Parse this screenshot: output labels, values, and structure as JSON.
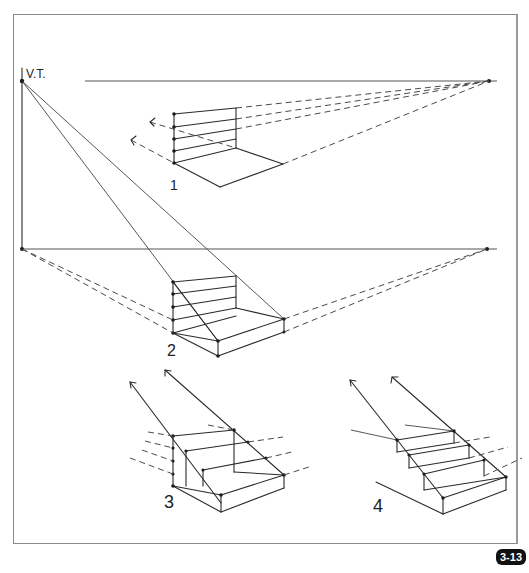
{
  "figure": {
    "number_badge": "3-13",
    "vertical_trace_label": "V.T.",
    "step_labels": [
      "1",
      "2",
      "3",
      "4"
    ],
    "colors": {
      "ink": "#2a2a2a",
      "frame": "#8a8a8a",
      "badge_bg": "#111111",
      "badge_text": "#ffffff",
      "background": "#ffffff"
    }
  }
}
